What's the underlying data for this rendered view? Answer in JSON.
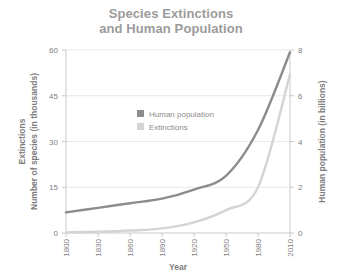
{
  "title": {
    "line1": "Species Extinctions",
    "line2": "and Human Population"
  },
  "colors": {
    "population": "#8c8c8c",
    "extinctions": "#d4d4d4",
    "title": "#9b9b9b",
    "grid": "#e9e9e9",
    "axis": "#c9c9c9",
    "text": "#808080",
    "background": "#ffffff"
  },
  "legend": {
    "position": "inside-top-center",
    "items": [
      {
        "label": "Human population",
        "swatch": "#8c8c8c"
      },
      {
        "label": "Extinctions",
        "swatch": "#d4d4d4"
      }
    ]
  },
  "axes": {
    "x": {
      "label": "Year",
      "ticks": [
        "1800",
        "1830",
        "1860",
        "1890",
        "1920",
        "1950",
        "1980",
        "2010"
      ],
      "min": 1800,
      "max": 2010,
      "rotated": true
    },
    "y_left": {
      "label_line1": "Extinctions",
      "label_line2": "Number of species (in thousands)",
      "ticks": [
        "0",
        "15",
        "30",
        "45",
        "60"
      ],
      "min": 0,
      "max": 60
    },
    "y_right": {
      "label": "Human population (in billions)",
      "ticks": [
        "0",
        "2",
        "4",
        "6",
        "8"
      ],
      "min": 0,
      "max": 8
    }
  },
  "chart_data": {
    "type": "line",
    "title": "Species Extinctions and Human Population",
    "xlabel": "Year",
    "ylabel": "Extinctions Number of species (in thousands)",
    "ylabel_right": "Human population (in billions)",
    "xlim": [
      1800,
      2010
    ],
    "ylim": [
      0,
      60
    ],
    "ylim_right": [
      0,
      8
    ],
    "grid": true,
    "legend_position": "inside-top-center",
    "x": [
      1800,
      1830,
      1860,
      1890,
      1920,
      1950,
      1980,
      2010
    ],
    "series": [
      {
        "name": "Human population",
        "axis": "right",
        "units": "billions",
        "color": "#8c8c8c",
        "values": [
          0.9,
          1.1,
          1.3,
          1.5,
          1.9,
          2.5,
          4.5,
          7.9
        ]
      },
      {
        "name": "Extinctions",
        "axis": "left",
        "units": "thousands of species",
        "color": "#d4d4d4",
        "values": [
          0.2,
          0.4,
          0.8,
          1.5,
          3.5,
          7.5,
          15.0,
          52.0
        ]
      }
    ]
  }
}
